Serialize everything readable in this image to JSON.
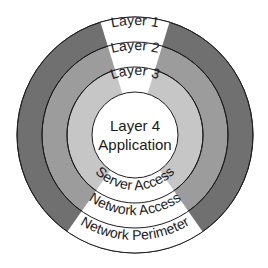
{
  "diagram": {
    "center": [
      135,
      135
    ],
    "rings": [
      {
        "name": "Layer 1",
        "role": "Network Perimeter",
        "outer_radius": 118,
        "color": "#707070"
      },
      {
        "name": "Layer 2",
        "role": "Network Access",
        "outer_radius": 93,
        "color": "#9c9c9c"
      },
      {
        "name": "Layer 3",
        "role": "Server Access",
        "outer_radius": 68,
        "color": "#c6c6c6"
      },
      {
        "name": "Layer 4",
        "role": "Application",
        "outer_radius": 43,
        "color": "#ffffff"
      }
    ],
    "wedge_color": "#ffffff",
    "stroke_color": "#1e1e1e",
    "top_labels": {
      "layer1": "Layer 1",
      "layer2": "Layer 2",
      "layer3": "Layer 3"
    },
    "center_label": {
      "line1": "Layer 4",
      "line2": "Application"
    },
    "bottom_labels": {
      "server_access": "Server Access",
      "network_access": "Network Access",
      "network_perimeter": "Network Perimeter"
    }
  }
}
